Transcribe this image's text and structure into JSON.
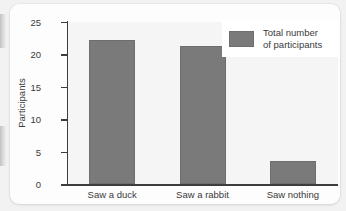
{
  "chart_data": {
    "type": "bar",
    "title": "",
    "subtitle": "",
    "xlabel": "",
    "ylabel": "Participants",
    "categories": [
      "Saw a duck",
      "Saw a rabbit",
      "Saw nothing"
    ],
    "values": [
      22.2,
      21.3,
      3.5
    ],
    "series": [
      {
        "name": "Total number of participants",
        "values": [
          22.2,
          21.3,
          3.5
        ]
      }
    ],
    "ylim": [
      0,
      25
    ],
    "yticks": [
      0,
      5,
      10,
      15,
      20,
      25
    ],
    "ytick_labels": [
      "0",
      "5",
      "10",
      "15",
      "20",
      "25"
    ],
    "grid": false,
    "legend_position": "top-right",
    "legend_entries": [
      "Total number of participants"
    ],
    "annotations": [],
    "colors": {
      "bar": "#7a7a7a",
      "bar_edge": "#6e6e6e",
      "axis": "#3d3d3d",
      "text": "#3a3a3a",
      "plot_background": "#f5f5f5",
      "card_background": "#fdfdfd",
      "page_background": "#f2f2f2",
      "legend_background": "#ffffff"
    }
  },
  "legend": {
    "label_line1": "Total number",
    "label_line2": "of participants"
  }
}
